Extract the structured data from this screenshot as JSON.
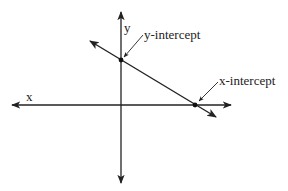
{
  "diagram": {
    "type": "coordinate-plane",
    "axes": {
      "x_label": "x",
      "y_label": "y"
    },
    "line": {
      "description": "line with negative slope",
      "points": {
        "y_intercept": {
          "label": "y-intercept"
        },
        "x_intercept": {
          "label": "x-intercept"
        }
      }
    },
    "colors": {
      "stroke": "#222222",
      "background": "#ffffff"
    }
  }
}
